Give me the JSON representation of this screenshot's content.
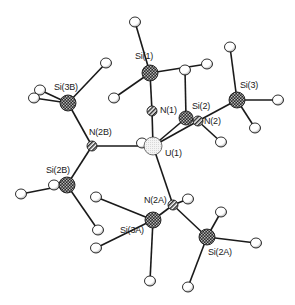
{
  "figure": {
    "type": "molecular-structure",
    "style": "ORTEP-like ball-and-stick",
    "central_atom": "U(1)"
  },
  "colors": {
    "bond": "#1a1a1a",
    "si_fill": "#555555",
    "n_fill": "#8a8a8a",
    "u_fill": "#e6e6e6",
    "h_fill": "#ffffff",
    "outline": "#1a1a1a"
  },
  "atoms": [
    {
      "id": "Si1",
      "label": "Si(1)",
      "element": "Si",
      "x": 150,
      "y": 73,
      "r": 8,
      "lx": 135,
      "ly": 52
    },
    {
      "id": "N1",
      "label": "N(1)",
      "element": "N",
      "x": 152,
      "y": 111,
      "r": 5,
      "lx": 160,
      "ly": 106
    },
    {
      "id": "U1",
      "label": "U(1)",
      "element": "U",
      "x": 153,
      "y": 146,
      "r": 9,
      "lx": 165,
      "ly": 149
    },
    {
      "id": "Si2",
      "label": "Si(2)",
      "element": "Si",
      "x": 186,
      "y": 118,
      "r": 7,
      "lx": 192,
      "ly": 102
    },
    {
      "id": "N2",
      "label": "N(2)",
      "element": "N",
      "x": 198,
      "y": 121,
      "r": 5,
      "lx": 204,
      "ly": 117
    },
    {
      "id": "Si3",
      "label": "Si(3)",
      "element": "Si",
      "x": 237,
      "y": 100,
      "r": 8,
      "lx": 240,
      "ly": 81
    },
    {
      "id": "Si3B",
      "label": "Si(3B)",
      "element": "Si",
      "x": 68,
      "y": 103,
      "r": 8,
      "lx": 54,
      "ly": 83
    },
    {
      "id": "N2B",
      "label": "N(2B)",
      "element": "N",
      "x": 92,
      "y": 146,
      "r": 5,
      "lx": 89,
      "ly": 128
    },
    {
      "id": "Si2B",
      "label": "Si(2B)",
      "element": "Si",
      "x": 67,
      "y": 185,
      "r": 8,
      "lx": 46,
      "ly": 166
    },
    {
      "id": "N2A",
      "label": "N(2A)",
      "element": "N",
      "x": 173,
      "y": 205,
      "r": 5,
      "lx": 144,
      "ly": 196
    },
    {
      "id": "Si3A",
      "label": "Si(3A)",
      "element": "Si",
      "x": 153,
      "y": 220,
      "r": 8,
      "lx": 120,
      "ly": 226
    },
    {
      "id": "Si2A",
      "label": "Si(2A)",
      "element": "Si",
      "x": 207,
      "y": 237,
      "r": 8,
      "lx": 208,
      "ly": 248
    }
  ],
  "terminal_atoms": [
    {
      "id": "H1a",
      "x": 135,
      "y": 22,
      "bond_to": "Si1"
    },
    {
      "id": "H1b",
      "x": 114,
      "y": 98,
      "bond_to": "Si1"
    },
    {
      "id": "H1c",
      "x": 207,
      "y": 64,
      "bond_to": "Si1"
    },
    {
      "id": "H2a",
      "x": 185,
      "y": 70,
      "bond_to": "Si2"
    },
    {
      "id": "H2b",
      "x": 221,
      "y": 142,
      "bond_to": "N2"
    },
    {
      "id": "H3a",
      "x": 230,
      "y": 47,
      "bond_to": "Si3"
    },
    {
      "id": "H3b",
      "x": 278,
      "y": 100,
      "bond_to": "Si3"
    },
    {
      "id": "H3c",
      "x": 255,
      "y": 128,
      "bond_to": "Si3"
    },
    {
      "id": "H3Ba",
      "x": 40,
      "y": 90,
      "bond_to": "Si3B"
    },
    {
      "id": "H3Bb",
      "x": 34,
      "y": 98,
      "bond_to": "Si3B"
    },
    {
      "id": "H3Bc",
      "x": 106,
      "y": 63,
      "bond_to": "Si3B"
    },
    {
      "id": "HU",
      "x": 142,
      "y": 143,
      "bond_to": "U1"
    },
    {
      "id": "H2Ba",
      "x": 21,
      "y": 194,
      "bond_to": "Si2B"
    },
    {
      "id": "H2Bb",
      "x": 54,
      "y": 185,
      "bond_to": "Si2B"
    },
    {
      "id": "H2Bc",
      "x": 98,
      "y": 230,
      "bond_to": "Si2B"
    },
    {
      "id": "H2Aa",
      "x": 188,
      "y": 199,
      "bond_to": "N2A"
    },
    {
      "id": "H3Aa",
      "x": 96,
      "y": 197,
      "bond_to": "Si3A"
    },
    {
      "id": "H3Ab",
      "x": 96,
      "y": 248,
      "bond_to": "Si3A"
    },
    {
      "id": "H3Ac",
      "x": 150,
      "y": 281,
      "bond_to": "Si3A"
    },
    {
      "id": "H2Ac",
      "x": 221,
      "y": 212,
      "bond_to": "Si2A"
    },
    {
      "id": "H2Ad",
      "x": 256,
      "y": 243,
      "bond_to": "Si2A"
    },
    {
      "id": "H2Ae",
      "x": 188,
      "y": 287,
      "bond_to": "Si2A"
    }
  ],
  "bonds": [
    [
      "Si1",
      "N1"
    ],
    [
      "N1",
      "U1"
    ],
    [
      "Si1",
      "H1a"
    ],
    [
      "Si1",
      "H1b"
    ],
    [
      "Si1",
      "H1c"
    ],
    [
      "Si2",
      "H2a"
    ],
    [
      "U1",
      "Si2"
    ],
    [
      "U1",
      "N2"
    ],
    [
      "Si2",
      "N2"
    ],
    [
      "N2",
      "Si3"
    ],
    [
      "N2",
      "H2b"
    ],
    [
      "Si3",
      "H3a"
    ],
    [
      "Si3",
      "H3b"
    ],
    [
      "Si3",
      "H3c"
    ],
    [
      "Si3B",
      "H3Ba"
    ],
    [
      "Si3B",
      "H3Bb"
    ],
    [
      "Si3B",
      "H3Bc"
    ],
    [
      "Si3B",
      "N2B"
    ],
    [
      "N2B",
      "U1"
    ],
    [
      "U1",
      "HU"
    ],
    [
      "N2B",
      "Si2B"
    ],
    [
      "Si2B",
      "H2Ba"
    ],
    [
      "Si2B",
      "H2Bb"
    ],
    [
      "Si2B",
      "H2Bc"
    ],
    [
      "U1",
      "N2A"
    ],
    [
      "N2A",
      "Si3A"
    ],
    [
      "N2A",
      "Si2A"
    ],
    [
      "N2A",
      "H2Aa"
    ],
    [
      "Si3A",
      "H3Aa"
    ],
    [
      "Si3A",
      "H3Ab"
    ],
    [
      "Si3A",
      "H3Ac"
    ],
    [
      "Si2A",
      "H2Ac"
    ],
    [
      "Si2A",
      "H2Ad"
    ],
    [
      "Si2A",
      "H2Ae"
    ]
  ],
  "labels": {
    "Si1": "Si(1)",
    "N1": "N(1)",
    "U1": "U(1)",
    "Si2": "Si(2)",
    "N2": "N(2)",
    "Si3": "Si(3)",
    "Si3B": "Si(3B)",
    "N2B": "N(2B)",
    "Si2B": "Si(2B)",
    "N2A": "N(2A)",
    "Si3A": "Si(3A)",
    "Si2A": "Si(2A)"
  }
}
